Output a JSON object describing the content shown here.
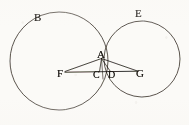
{
  "figure": {
    "kind": "geometric-diagram",
    "background_color": "#fbfaf7",
    "ink_color": "#1a1510",
    "stroke_width": 0.8,
    "circles": [
      {
        "name": "large-left-circle",
        "label": "B",
        "cx": 59,
        "cy": 61,
        "r": 49
      },
      {
        "name": "right-circle",
        "label": "E",
        "cx": 142,
        "cy": 59,
        "r": 38
      }
    ],
    "points": [
      {
        "id": "B",
        "label": "B",
        "x": 36,
        "y": 18,
        "anchor": "circle-left-top"
      },
      {
        "id": "E",
        "label": "E",
        "x": 137,
        "y": 14,
        "anchor": "circle-right-top"
      },
      {
        "id": "A",
        "label": "A",
        "x": 100,
        "y": 53,
        "anchor": "upper-intersection"
      },
      {
        "id": "F",
        "label": "F",
        "x": 60,
        "y": 72,
        "anchor": "left-center"
      },
      {
        "id": "C",
        "label": "C",
        "x": 96,
        "y": 72,
        "anchor": "baseline-mid-left"
      },
      {
        "id": "D",
        "label": "D",
        "x": 111,
        "y": 72,
        "anchor": "baseline-mid-right"
      },
      {
        "id": "G",
        "label": "G",
        "x": 139,
        "y": 72,
        "anchor": "right-center"
      }
    ],
    "segments": [
      {
        "name": "segment-F-A",
        "from": "F",
        "to": "A"
      },
      {
        "name": "segment-F-G",
        "from": "F",
        "to": "G"
      },
      {
        "name": "segment-A-C",
        "from": "A",
        "to": "C"
      },
      {
        "name": "segment-A-D",
        "from": "A",
        "to": "D"
      },
      {
        "name": "segment-A-G",
        "from": "A",
        "to": "G"
      },
      {
        "name": "segment-A-below",
        "from": "A",
        "to": "below-baseline"
      }
    ]
  }
}
